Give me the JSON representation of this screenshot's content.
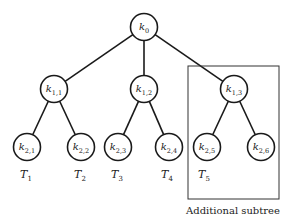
{
  "diagram": {
    "type": "tree",
    "nodes": [
      {
        "id": "k0",
        "base": "k",
        "sub": "0",
        "x": 144,
        "y": 27,
        "level": 0
      },
      {
        "id": "k11",
        "base": "k",
        "sub": "1,1",
        "x": 54,
        "y": 89,
        "level": 1
      },
      {
        "id": "k12",
        "base": "k",
        "sub": "1,2",
        "x": 144,
        "y": 89,
        "level": 1
      },
      {
        "id": "k13",
        "base": "k",
        "sub": "1,3",
        "x": 234,
        "y": 89,
        "level": 1
      },
      {
        "id": "k21",
        "base": "k",
        "sub": "2,1",
        "x": 27,
        "y": 147,
        "level": 2
      },
      {
        "id": "k22",
        "base": "k",
        "sub": "2,2",
        "x": 81,
        "y": 147,
        "level": 2
      },
      {
        "id": "k23",
        "base": "k",
        "sub": "2,3",
        "x": 118,
        "y": 147,
        "level": 2
      },
      {
        "id": "k24",
        "base": "k",
        "sub": "2,4",
        "x": 169,
        "y": 147,
        "level": 2
      },
      {
        "id": "k25",
        "base": "k",
        "sub": "2,5",
        "x": 207,
        "y": 147,
        "level": 2
      },
      {
        "id": "k26",
        "base": "k",
        "sub": "2,6",
        "x": 261,
        "y": 147,
        "level": 2
      }
    ],
    "edges": [
      [
        "k0",
        "k11"
      ],
      [
        "k0",
        "k12"
      ],
      [
        "k0",
        "k13"
      ],
      [
        "k11",
        "k21"
      ],
      [
        "k11",
        "k22"
      ],
      [
        "k12",
        "k23"
      ],
      [
        "k12",
        "k24"
      ],
      [
        "k13",
        "k25"
      ],
      [
        "k13",
        "k26"
      ]
    ],
    "leaf_labels": [
      {
        "base": "T",
        "sub": "1",
        "x": 26,
        "y": 178
      },
      {
        "base": "T",
        "sub": "2",
        "x": 80,
        "y": 178
      },
      {
        "base": "T",
        "sub": "3",
        "x": 117,
        "y": 178
      },
      {
        "base": "T",
        "sub": "4",
        "x": 167,
        "y": 178
      },
      {
        "base": "T",
        "sub": "5",
        "x": 204,
        "y": 178
      }
    ],
    "subtree_box": {
      "x": 188,
      "y": 66,
      "width": 91,
      "height": 133
    },
    "caption": "Additional subtree",
    "node_radius": 13.5
  }
}
